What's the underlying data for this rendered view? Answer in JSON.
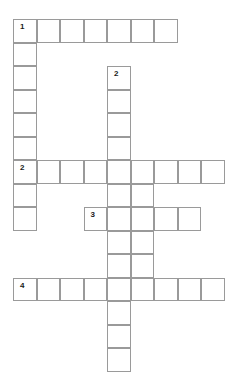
{
  "puzzle": {
    "kind": "crossword-grid",
    "title": "",
    "background_color": "#ffffff",
    "cell_fill_color": "#ffffff",
    "cell_border_color": "#9a9a9a",
    "number_color": "#1a1a1a",
    "geometry": {
      "origin_x": 13,
      "origin_y": 19,
      "cell_size": 23.5,
      "border_width": 1.5,
      "columns": 9,
      "rows": 15
    },
    "cells": [
      {
        "row": 0,
        "col": 0,
        "number": "1"
      },
      {
        "row": 0,
        "col": 1,
        "number": ""
      },
      {
        "row": 0,
        "col": 2,
        "number": ""
      },
      {
        "row": 0,
        "col": 3,
        "number": ""
      },
      {
        "row": 0,
        "col": 4,
        "number": ""
      },
      {
        "row": 0,
        "col": 5,
        "number": ""
      },
      {
        "row": 0,
        "col": 6,
        "number": ""
      },
      {
        "row": 1,
        "col": 0,
        "number": ""
      },
      {
        "row": 2,
        "col": 0,
        "number": ""
      },
      {
        "row": 2,
        "col": 4,
        "number": "2"
      },
      {
        "row": 3,
        "col": 0,
        "number": ""
      },
      {
        "row": 3,
        "col": 4,
        "number": ""
      },
      {
        "row": 4,
        "col": 0,
        "number": ""
      },
      {
        "row": 4,
        "col": 4,
        "number": ""
      },
      {
        "row": 5,
        "col": 0,
        "number": ""
      },
      {
        "row": 5,
        "col": 4,
        "number": ""
      },
      {
        "row": 6,
        "col": 0,
        "number": "2"
      },
      {
        "row": 6,
        "col": 1,
        "number": ""
      },
      {
        "row": 6,
        "col": 2,
        "number": ""
      },
      {
        "row": 6,
        "col": 3,
        "number": ""
      },
      {
        "row": 6,
        "col": 4,
        "number": ""
      },
      {
        "row": 6,
        "col": 5,
        "number": ""
      },
      {
        "row": 6,
        "col": 6,
        "number": ""
      },
      {
        "row": 6,
        "col": 7,
        "number": ""
      },
      {
        "row": 6,
        "col": 8,
        "number": ""
      },
      {
        "row": 7,
        "col": 0,
        "number": ""
      },
      {
        "row": 7,
        "col": 4,
        "number": ""
      },
      {
        "row": 7,
        "col": 5,
        "number": ""
      },
      {
        "row": 8,
        "col": 0,
        "number": ""
      },
      {
        "row": 8,
        "col": 3,
        "number": "3"
      },
      {
        "row": 8,
        "col": 4,
        "number": ""
      },
      {
        "row": 8,
        "col": 5,
        "number": ""
      },
      {
        "row": 8,
        "col": 6,
        "number": ""
      },
      {
        "row": 8,
        "col": 7,
        "number": ""
      },
      {
        "row": 9,
        "col": 4,
        "number": ""
      },
      {
        "row": 9,
        "col": 5,
        "number": ""
      },
      {
        "row": 10,
        "col": 4,
        "number": ""
      },
      {
        "row": 10,
        "col": 5,
        "number": ""
      },
      {
        "row": 11,
        "col": 0,
        "number": "4"
      },
      {
        "row": 11,
        "col": 1,
        "number": ""
      },
      {
        "row": 11,
        "col": 2,
        "number": ""
      },
      {
        "row": 11,
        "col": 3,
        "number": ""
      },
      {
        "row": 11,
        "col": 4,
        "number": ""
      },
      {
        "row": 11,
        "col": 5,
        "number": ""
      },
      {
        "row": 11,
        "col": 6,
        "number": ""
      },
      {
        "row": 11,
        "col": 7,
        "number": ""
      },
      {
        "row": 11,
        "col": 8,
        "number": ""
      },
      {
        "row": 12,
        "col": 4,
        "number": ""
      },
      {
        "row": 13,
        "col": 4,
        "number": ""
      },
      {
        "row": 14,
        "col": 4,
        "number": ""
      }
    ],
    "entries": [
      {
        "number": "1",
        "direction": "across",
        "row": 0,
        "col": 0,
        "length": 7,
        "answer": ""
      },
      {
        "number": "1",
        "direction": "down",
        "row": 0,
        "col": 0,
        "length": 9,
        "answer": ""
      },
      {
        "number": "2",
        "direction": "down",
        "row": 2,
        "col": 4,
        "length": 13,
        "answer": ""
      },
      {
        "number": "2",
        "direction": "across",
        "row": 6,
        "col": 0,
        "length": 9,
        "answer": ""
      },
      {
        "number": "3",
        "direction": "across",
        "row": 8,
        "col": 3,
        "length": 5,
        "answer": ""
      },
      {
        "number": "4",
        "direction": "across",
        "row": 11,
        "col": 0,
        "length": 9,
        "answer": ""
      }
    ]
  }
}
